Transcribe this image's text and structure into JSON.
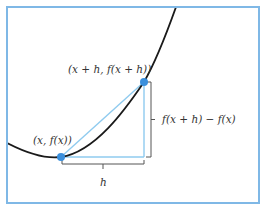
{
  "diagram": {
    "colors": {
      "frame": "#7fb8e6",
      "curve": "#1a1a1a",
      "secant": "#8fcbef",
      "point": "#3a8fdc",
      "bracket": "#555555",
      "text": "#333333"
    },
    "points": {
      "p1": {
        "label": "(x, f(x))",
        "cx": 61,
        "cy": 157
      },
      "p2": {
        "label": "(x + h, f(x + h))",
        "cx": 144,
        "cy": 82
      }
    },
    "labels": {
      "rise": "f(x + h) − f(x)",
      "run": "h"
    },
    "curve": {
      "description": "convex function curve",
      "path": "M 7 143 Q 40 160 61 157 C 95 152 125 110 144 82 C 155 63 166 35 176 7"
    }
  }
}
